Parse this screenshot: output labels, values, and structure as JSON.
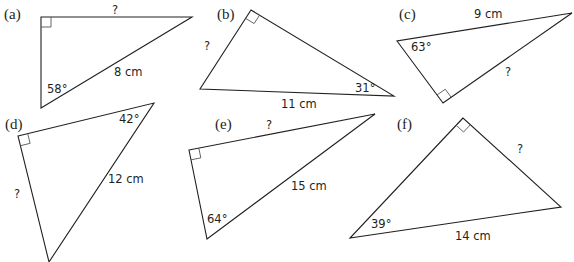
{
  "figure": {
    "stroke_color": "#231f20",
    "triangles": [
      {
        "id": "a",
        "part_label": "(a)",
        "vertices": [
          [
            41,
            17
          ],
          [
            192,
            17
          ],
          [
            41,
            108
          ]
        ],
        "right_angle_vertex": 0,
        "angle": {
          "text": "58°",
          "x": 47,
          "y": 84
        },
        "hypotenuse": {
          "text": "8 cm",
          "x": 114,
          "y": 67
        },
        "unknown": {
          "text": "?",
          "x": 112,
          "y": 5
        }
      },
      {
        "id": "b",
        "part_label": "(b)",
        "vertices": [
          [
            251,
            10
          ],
          [
            200,
            89
          ],
          [
            394,
            96
          ]
        ],
        "right_angle_vertex": 0,
        "angle": {
          "text": "31°",
          "x": 355,
          "y": 83
        },
        "hypotenuse": {
          "text": "11 cm",
          "x": 281,
          "y": 99
        },
        "unknown": {
          "text": "?",
          "x": 204,
          "y": 41
        }
      },
      {
        "id": "c",
        "part_label": "(c)",
        "vertices": [
          [
            443,
            103
          ],
          [
            397,
            41
          ],
          [
            572,
            13
          ]
        ],
        "right_angle_vertex": 0,
        "angle": {
          "text": "63°",
          "x": 411,
          "y": 42
        },
        "hypotenuse": {
          "text": "9 cm",
          "x": 474,
          "y": 9
        },
        "unknown": {
          "text": "?",
          "x": 505,
          "y": 67
        }
      },
      {
        "id": "d",
        "part_label": "(d)",
        "vertices": [
          [
            18,
            136
          ],
          [
            154,
            103
          ],
          [
            49,
            262
          ]
        ],
        "right_angle_vertex": 0,
        "angle": {
          "text": "42°",
          "x": 119,
          "y": 114
        },
        "hypotenuse": {
          "text": "12 cm",
          "x": 108,
          "y": 174
        },
        "unknown": {
          "text": "?",
          "x": 14,
          "y": 189
        }
      },
      {
        "id": "e",
        "part_label": "(e)",
        "vertices": [
          [
            189,
            150
          ],
          [
            375,
            114
          ],
          [
            207,
            239
          ]
        ],
        "right_angle_vertex": 0,
        "angle": {
          "text": "64°",
          "x": 207,
          "y": 214
        },
        "hypotenuse": {
          "text": "15 cm",
          "x": 291,
          "y": 181
        },
        "unknown": {
          "text": "?",
          "x": 266,
          "y": 120
        }
      },
      {
        "id": "f",
        "part_label": "(f)",
        "vertices": [
          [
            463,
            118
          ],
          [
            350,
            238
          ],
          [
            561,
            207
          ]
        ],
        "right_angle_vertex": 0,
        "angle": {
          "text": "39°",
          "x": 371,
          "y": 219
        },
        "hypotenuse": {
          "text": "14 cm",
          "x": 455,
          "y": 231
        },
        "unknown": {
          "text": "?",
          "x": 517,
          "y": 144
        }
      }
    ],
    "part_label_positions": {
      "a": {
        "x": 4,
        "y": 7
      },
      "b": {
        "x": 217,
        "y": 7
      },
      "c": {
        "x": 399,
        "y": 7
      },
      "d": {
        "x": 5,
        "y": 117
      },
      "e": {
        "x": 215,
        "y": 117
      },
      "f": {
        "x": 397,
        "y": 117
      }
    }
  }
}
